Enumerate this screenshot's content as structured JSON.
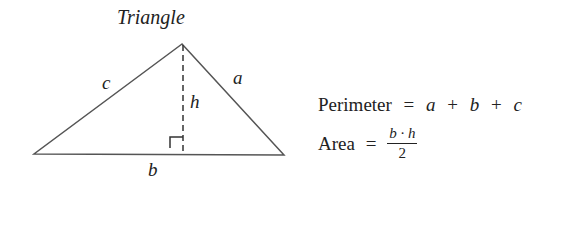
{
  "diagram": {
    "title": "Triangle",
    "colors": {
      "stroke": "#555555",
      "text": "#222222",
      "background": "#ffffff"
    },
    "vertices": {
      "apex": [
        182,
        44
      ],
      "left": [
        34,
        154
      ],
      "right": [
        284,
        155
      ]
    },
    "labels": {
      "side_c": "c",
      "side_a": "a",
      "side_b": "b",
      "height": "h"
    },
    "altitude_style": "dashed",
    "right_angle_marker": true
  },
  "formulas": {
    "perimeter": {
      "label": "Perimeter",
      "equals": "=",
      "terms": [
        "a",
        "b",
        "c"
      ],
      "op": "+"
    },
    "area": {
      "label": "Area",
      "equals": "=",
      "numerator": "b · h",
      "denominator": "2"
    }
  }
}
